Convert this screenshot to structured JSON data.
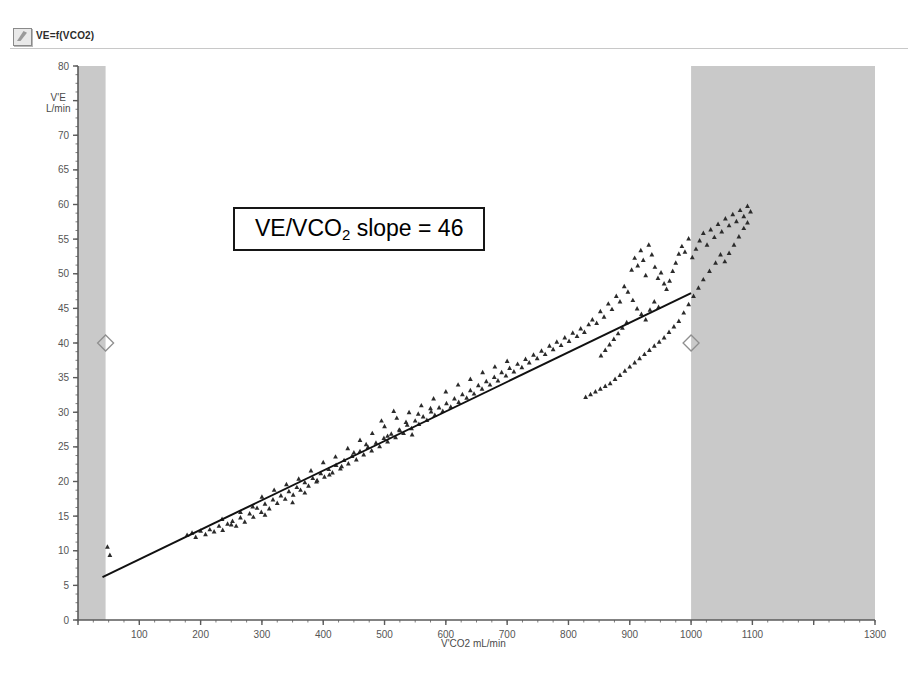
{
  "window": {
    "title": "VE=f(VCO2)",
    "icon": "chart-document-icon"
  },
  "annotation": {
    "prefix": "VE/VCO",
    "subscript": "2",
    "suffix": " slope = 46",
    "value": 46
  },
  "axis_titles": {
    "y_line1": "V'E",
    "y_line2": "L/min",
    "x": "V'CO2 mL/min"
  },
  "colors": {
    "band_gray": "#c9c9c9",
    "axis": "#5a5a5a",
    "tick_text": "#555555",
    "marker": "#2b2b2b",
    "regression_line": "#111111",
    "annotation_border": "#161616",
    "title_rule": "#c8c8c8"
  },
  "chart_data": {
    "type": "scatter",
    "title": "VE=f(VCO2)",
    "xlabel": "V'CO2 mL/min",
    "ylabel": "V'E L/min",
    "xlim": [
      0,
      1300
    ],
    "ylim": [
      0,
      80
    ],
    "grid": false,
    "legend": null,
    "xticks": [
      0,
      100,
      200,
      300,
      400,
      500,
      600,
      700,
      800,
      900,
      1000,
      1100,
      1200,
      1300
    ],
    "xticklabels": [
      "",
      "100",
      "200",
      "300",
      "400",
      "500",
      "600",
      "700",
      "800",
      "900",
      "1000",
      "1100",
      "",
      "1300"
    ],
    "yticks": [
      0,
      5,
      10,
      15,
      20,
      25,
      30,
      35,
      40,
      45,
      50,
      55,
      60,
      65,
      70,
      75,
      80
    ],
    "yticklabels": [
      "0",
      "5",
      "10",
      "15",
      "20",
      "25",
      "30",
      "35",
      "40",
      "45",
      "50",
      "55",
      "60",
      "65",
      "70",
      "",
      "80"
    ],
    "x_minor_tick_step": 25,
    "y_minor_tick_step": 1.25,
    "shaded_regions": [
      {
        "name": "left-exclusion-band",
        "x_from": 0,
        "x_to": 45,
        "color": "#c9c9c9"
      },
      {
        "name": "right-exclusion-band",
        "x_from": 1000,
        "x_to": 1300,
        "color": "#c9c9c9"
      }
    ],
    "marker_diamonds": [
      {
        "name": "left-range-handle",
        "x": 45,
        "y": 40
      },
      {
        "name": "right-range-handle",
        "x": 1000,
        "y": 40
      }
    ],
    "regression": {
      "name": "VE/VCO2 slope",
      "slope": 46,
      "x_from": 40,
      "y_from": 6.2,
      "x_to": 1000,
      "y_to": 47.2
    },
    "series": [
      {
        "name": "V'E vs V'CO2",
        "marker": "triangle",
        "color": "#2b2b2b",
        "points": [
          [
            48,
            10.6
          ],
          [
            52,
            9.4
          ],
          [
            178,
            12.3
          ],
          [
            186,
            12.6
          ],
          [
            192,
            12.0
          ],
          [
            200,
            12.9
          ],
          [
            208,
            12.4
          ],
          [
            215,
            13.1
          ],
          [
            222,
            12.8
          ],
          [
            230,
            13.6
          ],
          [
            236,
            13.0
          ],
          [
            244,
            13.9
          ],
          [
            252,
            14.3
          ],
          [
            258,
            13.6
          ],
          [
            265,
            14.8
          ],
          [
            272,
            14.2
          ],
          [
            280,
            15.4
          ],
          [
            286,
            14.9
          ],
          [
            292,
            16.2
          ],
          [
            299,
            15.6
          ],
          [
            305,
            16.8
          ],
          [
            312,
            16.1
          ],
          [
            318,
            17.4
          ],
          [
            325,
            16.9
          ],
          [
            331,
            18.0
          ],
          [
            338,
            17.5
          ],
          [
            344,
            18.6
          ],
          [
            351,
            18.1
          ],
          [
            357,
            19.2
          ],
          [
            363,
            18.8
          ],
          [
            370,
            19.9
          ],
          [
            376,
            19.4
          ],
          [
            383,
            20.5
          ],
          [
            389,
            20.0
          ],
          [
            396,
            21.2
          ],
          [
            402,
            20.7
          ],
          [
            409,
            21.8
          ],
          [
            415,
            21.3
          ],
          [
            421,
            22.4
          ],
          [
            428,
            21.9
          ],
          [
            434,
            23.1
          ],
          [
            441,
            22.6
          ],
          [
            447,
            23.7
          ],
          [
            454,
            23.2
          ],
          [
            460,
            24.4
          ],
          [
            466,
            23.9
          ],
          [
            473,
            25.0
          ],
          [
            479,
            24.5
          ],
          [
            486,
            25.6
          ],
          [
            492,
            25.1
          ],
          [
            499,
            26.3
          ],
          [
            505,
            25.8
          ],
          [
            511,
            26.9
          ],
          [
            518,
            26.4
          ],
          [
            524,
            27.5
          ],
          [
            531,
            27.0
          ],
          [
            537,
            28.2
          ],
          [
            544,
            27.7
          ],
          [
            550,
            28.8
          ],
          [
            556,
            28.3
          ],
          [
            563,
            29.4
          ],
          [
            569,
            28.9
          ],
          [
            576,
            30.1
          ],
          [
            582,
            29.6
          ],
          [
            589,
            30.7
          ],
          [
            595,
            30.2
          ],
          [
            601,
            31.3
          ],
          [
            608,
            30.8
          ],
          [
            614,
            32.0
          ],
          [
            621,
            31.5
          ],
          [
            627,
            32.6
          ],
          [
            634,
            32.1
          ],
          [
            640,
            33.2
          ],
          [
            646,
            32.7
          ],
          [
            653,
            33.9
          ],
          [
            659,
            33.4
          ],
          [
            666,
            34.5
          ],
          [
            672,
            34.0
          ],
          [
            679,
            35.1
          ],
          [
            685,
            34.6
          ],
          [
            691,
            35.8
          ],
          [
            698,
            35.3
          ],
          [
            704,
            36.4
          ],
          [
            711,
            35.9
          ],
          [
            717,
            37.0
          ],
          [
            724,
            36.5
          ],
          [
            730,
            37.7
          ],
          [
            736,
            37.2
          ],
          [
            743,
            38.3
          ],
          [
            749,
            37.8
          ],
          [
            756,
            38.9
          ],
          [
            762,
            38.4
          ],
          [
            769,
            39.6
          ],
          [
            775,
            39.1
          ],
          [
            781,
            40.2
          ],
          [
            788,
            39.7
          ],
          [
            794,
            40.8
          ],
          [
            801,
            40.3
          ],
          [
            807,
            41.5
          ],
          [
            814,
            41.0
          ],
          [
            820,
            42.1
          ],
          [
            826,
            41.6
          ],
          [
            833,
            42.7
          ],
          [
            839,
            43.4
          ],
          [
            846,
            42.9
          ],
          [
            852,
            44.6
          ],
          [
            858,
            43.8
          ],
          [
            865,
            45.7
          ],
          [
            871,
            44.9
          ],
          [
            878,
            46.8
          ],
          [
            884,
            46.0
          ],
          [
            891,
            48.2
          ],
          [
            897,
            47.4
          ],
          [
            903,
            50.6
          ],
          [
            908,
            52.3
          ],
          [
            913,
            51.2
          ],
          [
            918,
            53.4
          ],
          [
            922,
            52.0
          ],
          [
            926,
            49.8
          ],
          [
            931,
            54.2
          ],
          [
            936,
            52.8
          ],
          [
            941,
            51.0
          ],
          [
            946,
            49.4
          ],
          [
            951,
            50.2
          ],
          [
            956,
            48.6
          ],
          [
            960,
            47.8
          ],
          [
            965,
            49.0
          ],
          [
            970,
            50.4
          ],
          [
            975,
            51.6
          ],
          [
            980,
            52.9
          ],
          [
            985,
            54.0
          ],
          [
            990,
            53.2
          ],
          [
            996,
            55.1
          ],
          [
            1002,
            52.4
          ],
          [
            1008,
            53.6
          ],
          [
            1014,
            54.8
          ],
          [
            1020,
            55.9
          ],
          [
            1026,
            54.2
          ],
          [
            1032,
            56.4
          ],
          [
            1038,
            55.3
          ],
          [
            1044,
            57.2
          ],
          [
            1050,
            56.1
          ],
          [
            1056,
            58.0
          ],
          [
            1062,
            57.0
          ],
          [
            1068,
            58.6
          ],
          [
            1074,
            57.6
          ],
          [
            1080,
            59.2
          ],
          [
            1086,
            58.3
          ],
          [
            1092,
            59.8
          ],
          [
            1097,
            59.0
          ],
          [
            1040,
            51.6
          ],
          [
            1048,
            52.8
          ],
          [
            1030,
            50.4
          ],
          [
            1020,
            49.2
          ],
          [
            1012,
            48.0
          ],
          [
            1004,
            46.8
          ],
          [
            996,
            45.6
          ],
          [
            988,
            44.4
          ],
          [
            980,
            43.2
          ],
          [
            972,
            42.4
          ],
          [
            964,
            41.6
          ],
          [
            956,
            40.8
          ],
          [
            948,
            40.2
          ],
          [
            940,
            39.6
          ],
          [
            932,
            39.0
          ],
          [
            924,
            38.4
          ],
          [
            916,
            37.8
          ],
          [
            908,
            37.2
          ],
          [
            900,
            36.6
          ],
          [
            892,
            36.0
          ],
          [
            884,
            35.4
          ],
          [
            876,
            34.8
          ],
          [
            868,
            34.2
          ],
          [
            860,
            33.8
          ],
          [
            852,
            33.4
          ],
          [
            844,
            33.0
          ],
          [
            836,
            32.6
          ],
          [
            828,
            32.2
          ],
          [
            1062,
            53.0
          ],
          [
            1070,
            54.2
          ],
          [
            1078,
            55.4
          ],
          [
            1086,
            56.6
          ],
          [
            1092,
            57.4
          ],
          [
            1055,
            51.8
          ],
          [
            905,
            46.2
          ],
          [
            912,
            45.0
          ],
          [
            919,
            44.2
          ],
          [
            926,
            43.4
          ],
          [
            933,
            44.8
          ],
          [
            940,
            46.0
          ],
          [
            947,
            45.2
          ],
          [
            895,
            43.0
          ],
          [
            888,
            42.2
          ],
          [
            881,
            41.4
          ],
          [
            874,
            40.6
          ],
          [
            867,
            39.8
          ],
          [
            860,
            39.0
          ],
          [
            853,
            38.2
          ],
          [
            300,
            17.8
          ],
          [
            320,
            18.8
          ],
          [
            340,
            19.6
          ],
          [
            360,
            20.4
          ],
          [
            380,
            21.6
          ],
          [
            400,
            22.8
          ],
          [
            420,
            23.6
          ],
          [
            440,
            24.8
          ],
          [
            460,
            26.0
          ],
          [
            480,
            27.0
          ],
          [
            500,
            28.0
          ],
          [
            520,
            29.2
          ],
          [
            540,
            30.0
          ],
          [
            560,
            31.0
          ],
          [
            580,
            32.0
          ],
          [
            600,
            33.0
          ],
          [
            620,
            34.0
          ],
          [
            640,
            34.8
          ],
          [
            660,
            35.8
          ],
          [
            680,
            36.6
          ],
          [
            700,
            37.4
          ],
          [
            265,
            15.6
          ],
          [
            285,
            16.4
          ],
          [
            305,
            15.2
          ],
          [
            250,
            13.8
          ],
          [
            235,
            14.6
          ],
          [
            495,
            28.8
          ],
          [
            515,
            30.2
          ],
          [
            535,
            28.6
          ],
          [
            555,
            29.8
          ],
          [
            575,
            30.6
          ],
          [
            505,
            26.6
          ],
          [
            525,
            27.4
          ],
          [
            545,
            26.8
          ],
          [
            470,
            25.4
          ],
          [
            450,
            24.2
          ],
          [
            430,
            22.2
          ],
          [
            410,
            21.0
          ],
          [
            390,
            20.2
          ],
          [
            370,
            18.4
          ],
          [
            350,
            17.0
          ]
        ]
      }
    ]
  }
}
